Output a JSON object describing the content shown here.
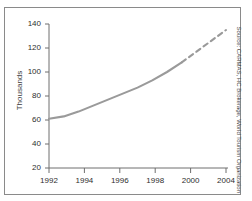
{
  "figure": {
    "title": "GROWTH IN HOTEL ROOMS",
    "source_note": "Source: CARMAS, HC Brokerage, World Tourism Organization"
  },
  "colors": {
    "frame": "#8a8a8a",
    "axis": "#6f6f6f",
    "series_line": "#9a9a9a",
    "forecast_line": "#9a9a9a",
    "text": "#2e2e2e"
  },
  "chart_data": {
    "type": "line",
    "title": "GROWTH IN HOTEL ROOMS",
    "xlabel": "",
    "ylabel": "Thousands",
    "ylim": [
      20,
      140
    ],
    "xlim": [
      1992,
      2004
    ],
    "grid": false,
    "legend": "none",
    "y_ticks": [
      20,
      40,
      60,
      80,
      100,
      120,
      140
    ],
    "x_ticks": [
      1992,
      1994,
      1996,
      1998,
      2000,
      2004
    ],
    "series": [
      {
        "name": "Hotel rooms (actual)",
        "style": "solid",
        "x": [
          1992,
          1993,
          1994,
          1995,
          1996,
          1997,
          1998,
          1999,
          2000,
          2001
        ],
        "values": [
          61,
          63,
          67,
          72,
          77,
          82,
          87,
          93,
          100,
          108
        ]
      },
      {
        "name": "Hotel rooms (forecast)",
        "style": "dashed",
        "x": [
          2001,
          2002,
          2003,
          2004
        ],
        "values": [
          108,
          117,
          126,
          135
        ]
      }
    ]
  },
  "axes": {
    "y_tick_labels": [
      "140",
      "120",
      "100",
      "80",
      "60",
      "40",
      "20"
    ],
    "x_tick_labels": [
      "1992",
      "1994",
      "1996",
      "1998",
      "2000",
      "2004"
    ]
  }
}
